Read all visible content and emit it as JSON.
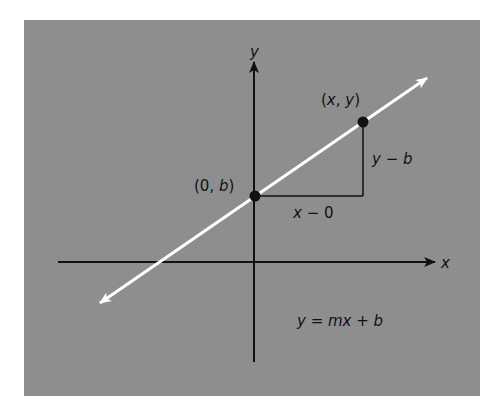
{
  "diagram": {
    "axes": {
      "x_label": "x",
      "y_label": "y"
    },
    "points": [
      {
        "name": "y-intercept",
        "label": "(0, b)",
        "label_parts": [
          "(0, ",
          "b",
          ")"
        ]
      },
      {
        "name": "general-point",
        "label": "(x, y)",
        "label_parts": [
          "(",
          "x",
          ", ",
          "y",
          ")"
        ]
      }
    ],
    "run_label": "x − 0",
    "run_parts": [
      "x",
      " − 0"
    ],
    "rise_label": "y − b",
    "rise_parts": [
      "y",
      " − ",
      "b"
    ],
    "equation": "y = mx + b",
    "equation_parts": [
      "y",
      " = ",
      "mx",
      " + ",
      "b"
    ],
    "colors": {
      "background": "#8e8e8e",
      "line": "#ffffff",
      "axes": "#111111",
      "points": "#111111"
    }
  }
}
